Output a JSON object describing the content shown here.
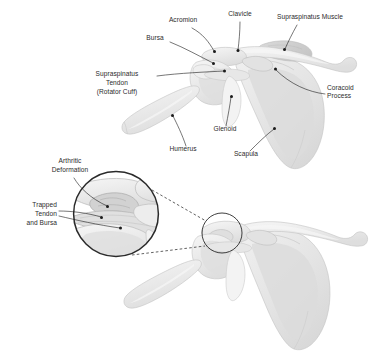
{
  "figure": {
    "background_color": "#ffffff",
    "label_color": "#2b2b2b",
    "leader_color": "#1b1b1b",
    "bone_fill_color": "#ececec",
    "muscle_fill_color": "#d5d5d5",
    "ring_color": "#2a2a2a"
  },
  "top_view": {
    "name": "normal-shoulder-anterior-view",
    "labels": [
      {
        "id": "acromion",
        "text": "Acromion",
        "anchor": "middle",
        "x": 183,
        "y": 22
      },
      {
        "id": "clavicle",
        "text": "Clavicle",
        "anchor": "middle",
        "x": 240,
        "y": 16
      },
      {
        "id": "supraspinatus-muscle",
        "text": "Supraspinatus Muscle",
        "anchor": "start",
        "x": 277,
        "y": 19
      },
      {
        "id": "bursa",
        "text": "Bursa",
        "anchor": "middle",
        "x": 155,
        "y": 40
      },
      {
        "id": "coracoid-process",
        "text": "Coracoid",
        "anchor": "start",
        "x": 327,
        "y": 90
      },
      {
        "id": "coracoid-process-2",
        "text": "Process",
        "anchor": "start",
        "x": 327,
        "y": 98
      },
      {
        "id": "glenoid",
        "text": "Glenoid",
        "anchor": "middle",
        "x": 225,
        "y": 131
      },
      {
        "id": "humerus",
        "text": "Humerus",
        "anchor": "middle",
        "x": 183,
        "y": 151
      },
      {
        "id": "scapula",
        "text": "Scapula",
        "anchor": "middle",
        "x": 246,
        "y": 156
      }
    ],
    "multiline_labels": [
      {
        "id": "supraspinatus-tendon",
        "anchor": "middle",
        "x": 117,
        "y": 76,
        "lines": [
          "Supraspinatus",
          "Tendon",
          "(Rotator Cuff)"
        ]
      }
    ]
  },
  "bottom_view": {
    "name": "arthritic-shoulder-with-magnified-inset",
    "multiline_labels": [
      {
        "id": "arthritic-deformation",
        "anchor": "middle",
        "x": 70,
        "y": 163,
        "lines": [
          "Arthritic",
          "Deformation"
        ]
      },
      {
        "id": "trapped-tendon-and-bursa",
        "anchor": "end",
        "x": 57,
        "y": 213,
        "lines": [
          "Trapped",
          "Tendon",
          "and Bursa"
        ]
      }
    ],
    "magnifier": {
      "id": "magnified-inset-circle",
      "center_x": 116,
      "center_y": 214,
      "radius": 43
    },
    "source_marker": {
      "id": "inset-source-circle",
      "center_x": 222,
      "center_y": 233,
      "radius": 20
    }
  }
}
